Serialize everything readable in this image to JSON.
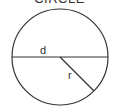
{
  "diagram": {
    "title": "CIRCLE",
    "labels": {
      "diameter": "d",
      "radius": "r"
    },
    "colors": {
      "stroke": "#333333",
      "background": "#ffffff"
    }
  }
}
